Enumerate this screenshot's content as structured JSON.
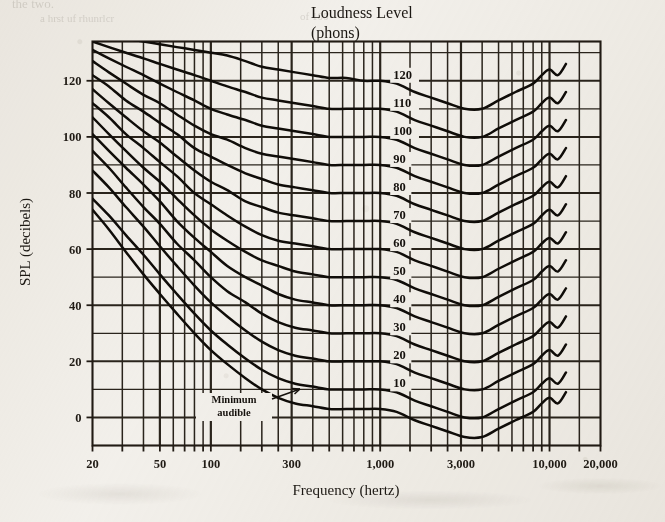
{
  "figure": {
    "title_line1": "Loudness Level",
    "title_line2": "(phons)",
    "xlabel": "Frequency (hertz)",
    "ylabel": "SPL (decibels)",
    "annotation": {
      "line1": "Minimum",
      "line2": "audible"
    },
    "ink_color": "#100d09",
    "paper_color": "#f4f2ee"
  },
  "bleed_through": [
    {
      "text": "the two.",
      "x": 12,
      "y": -4,
      "size": 13
    },
    {
      "text": "a  hrst  uf  rhunrlcr",
      "x": 40,
      "y": 12,
      "size": 11
    },
    {
      "text": "of 100",
      "x": 300,
      "y": 10,
      "size": 11
    }
  ],
  "chart_data": {
    "type": "line",
    "title": "Loudness Level (phons)",
    "xlabel": "Frequency (hertz)",
    "ylabel": "SPL (decibels)",
    "xscale": "log",
    "xlim": [
      20,
      20000
    ],
    "ylim": [
      -10,
      134
    ],
    "grid": true,
    "legend": "inline-labels-at-1000Hz",
    "xticks": [
      20,
      50,
      100,
      300,
      1000,
      3000,
      10000,
      20000
    ],
    "xticklabels": [
      "20",
      "50",
      "100",
      "300",
      "1,000",
      "3,000",
      "10,000",
      "20,000"
    ],
    "yticks": [
      0,
      20,
      40,
      60,
      80,
      100,
      120
    ],
    "yticklabels": [
      "0",
      "20",
      "40",
      "60",
      "80",
      "100",
      "120"
    ],
    "x_minor_ticks": [
      30,
      40,
      60,
      70,
      80,
      90,
      150,
      200,
      250,
      400,
      500,
      600,
      700,
      800,
      900,
      1500,
      2000,
      2500,
      4000,
      5000,
      6000,
      7000,
      8000,
      9000,
      15000
    ],
    "y_minor_ticks": [
      10,
      30,
      50,
      70,
      90,
      110,
      130
    ],
    "x": [
      20,
      25,
      31.5,
      40,
      50,
      63,
      80,
      100,
      125,
      160,
      200,
      250,
      315,
      400,
      500,
      630,
      800,
      1000,
      1250,
      1600,
      2000,
      2500,
      3150,
      4000,
      5000,
      6300,
      8000,
      9000,
      10000,
      11200,
      12500
    ],
    "series": [
      {
        "name": "10",
        "label": "10",
        "phon": 10,
        "values": [
          78,
          72,
          65,
          58,
          51,
          44,
          37,
          31,
          26,
          21,
          17,
          14,
          12,
          11,
          10,
          10,
          10,
          10,
          9,
          6,
          4,
          2,
          0,
          0,
          3,
          6,
          9,
          12,
          14,
          12,
          16
        ]
      },
      {
        "name": "20",
        "label": "20",
        "phon": 20,
        "values": [
          88,
          82,
          75,
          68,
          61,
          54,
          47,
          41,
          36,
          31,
          27,
          24,
          22,
          21,
          20,
          20,
          20,
          20,
          19,
          16,
          14,
          12,
          10,
          10,
          13,
          16,
          19,
          22,
          24,
          22,
          26
        ]
      },
      {
        "name": "30",
        "label": "30",
        "phon": 30,
        "values": [
          95,
          89,
          82,
          75,
          69,
          62,
          56,
          50,
          45,
          41,
          37,
          34,
          32,
          31,
          30,
          30,
          30,
          30,
          29,
          26,
          24,
          22,
          20,
          20,
          23,
          26,
          29,
          32,
          34,
          32,
          36
        ]
      },
      {
        "name": "40",
        "label": "40",
        "phon": 40,
        "values": [
          101,
          95,
          89,
          83,
          77,
          70,
          64,
          59,
          54,
          50,
          47,
          44,
          42,
          41,
          40,
          40,
          40,
          40,
          39,
          36,
          34,
          32,
          30,
          30,
          33,
          36,
          39,
          42,
          44,
          42,
          46
        ]
      },
      {
        "name": "50",
        "label": "50",
        "phon": 50,
        "values": [
          107,
          101,
          95,
          89,
          84,
          78,
          72,
          67,
          63,
          59,
          56,
          54,
          52,
          51,
          50,
          50,
          50,
          50,
          49,
          46,
          44,
          42,
          40,
          40,
          43,
          46,
          49,
          52,
          54,
          52,
          56
        ]
      },
      {
        "name": "60",
        "label": "60",
        "phon": 60,
        "values": [
          112,
          107,
          101,
          96,
          91,
          86,
          80,
          76,
          72,
          68,
          65,
          63,
          62,
          61,
          60,
          60,
          60,
          60,
          59,
          56,
          54,
          52,
          50,
          50,
          53,
          56,
          59,
          62,
          64,
          62,
          66
        ]
      },
      {
        "name": "70",
        "label": "70",
        "phon": 70,
        "values": [
          117,
          112,
          107,
          102,
          98,
          93,
          88,
          84,
          81,
          77,
          75,
          73,
          72,
          71,
          70,
          70,
          70,
          70,
          69,
          66,
          64,
          62,
          60,
          60,
          63,
          66,
          69,
          72,
          74,
          72,
          76
        ]
      },
      {
        "name": "80",
        "label": "80",
        "phon": 80,
        "values": [
          122,
          118,
          113,
          109,
          105,
          101,
          96,
          93,
          90,
          87,
          85,
          83,
          82,
          81,
          80,
          80,
          80,
          80,
          79,
          76,
          74,
          72,
          70,
          70,
          73,
          76,
          79,
          82,
          84,
          82,
          86
        ]
      },
      {
        "name": "90",
        "label": "90",
        "phon": 90,
        "values": [
          127,
          123,
          119,
          115,
          112,
          108,
          104,
          101,
          99,
          96,
          94,
          93,
          92,
          91,
          90,
          90,
          90,
          90,
          89,
          86,
          84,
          82,
          80,
          80,
          83,
          86,
          89,
          92,
          94,
          92,
          96
        ]
      },
      {
        "name": "100",
        "label": "100",
        "phon": 100,
        "values": [
          131,
          128,
          125,
          122,
          119,
          116,
          113,
          110,
          108,
          106,
          104,
          103,
          102,
          101,
          100,
          100,
          100,
          100,
          99,
          96,
          94,
          92,
          90,
          90,
          93,
          96,
          99,
          102,
          104,
          102,
          106
        ]
      },
      {
        "name": "110",
        "label": "110",
        "phon": 110,
        "values": [
          134,
          132,
          130,
          128,
          126,
          124,
          122,
          120,
          118,
          116,
          114,
          113,
          112,
          111,
          110,
          110,
          110,
          110,
          109,
          106,
          104,
          102,
          100,
          100,
          103,
          106,
          109,
          112,
          114,
          112,
          116
        ]
      },
      {
        "name": "120",
        "label": "120",
        "phon": 120,
        "values": [
          137,
          136,
          135,
          134,
          133,
          132,
          131,
          130,
          129,
          127,
          125,
          124,
          123,
          122,
          121,
          121,
          120,
          120,
          119,
          116,
          114,
          112,
          110,
          110,
          113,
          116,
          119,
          122,
          124,
          122,
          126
        ]
      },
      {
        "name": "minimum-audible",
        "label": "",
        "phon": 0,
        "values": [
          74,
          67,
          59,
          51,
          44,
          37,
          30,
          24,
          19,
          14,
          10,
          7,
          5,
          4,
          3,
          3,
          3,
          3,
          2,
          -1,
          -3,
          -5,
          -7,
          -7,
          -4,
          -1,
          2,
          5,
          7,
          5,
          9
        ]
      }
    ]
  }
}
